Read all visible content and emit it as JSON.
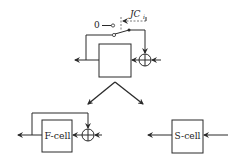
{
  "diagram": {
    "top_block": {
      "label": "",
      "switch": {
        "open_contact_label": "0",
        "control_signal": {
          "label": "JC",
          "subscript": "i"
        }
      }
    },
    "split_arrows": [
      "to-f-cell",
      "to-s-cell"
    ],
    "f_cell": {
      "label": "F-cell",
      "has_feedback": true,
      "has_summing_junction": true
    },
    "s_cell": {
      "label": "S-cell",
      "has_feedback": false
    },
    "colors": {
      "stroke": "#2a2a2a",
      "background": "#ffffff"
    }
  }
}
